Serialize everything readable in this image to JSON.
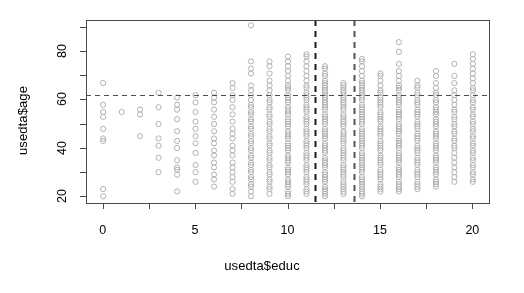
{
  "figure": {
    "type": "r-base-scatterplot",
    "width": 524,
    "height": 293,
    "background": "#ffffff"
  },
  "axes": {
    "x_title": "usedta$educ",
    "y_title": "usedta$age",
    "x_ticks": [
      "0",
      "5",
      "10",
      "15",
      "20"
    ],
    "y_ticks": [
      "20",
      "40",
      "60",
      "80"
    ]
  },
  "chart_data": {
    "type": "scatter",
    "title": "",
    "subtitle": "",
    "xlabel": "usedta$educ",
    "ylabel": "usedta$age",
    "xlim": [
      -0.9,
      20.9
    ],
    "ylim": [
      17,
      93
    ],
    "x_ticks": [
      0,
      5,
      10,
      15,
      20
    ],
    "y_ticks": [
      20,
      40,
      60,
      80
    ],
    "x_minor_ticks": [
      2.5,
      7.5,
      12.5,
      17.5
    ],
    "y_minor_ticks": [
      30,
      50,
      70,
      90
    ],
    "grid": false,
    "legend": null,
    "point_marker": "open-circle",
    "point_color": "#b0b0b0",
    "point_radius": 2.6,
    "annotations": [
      {
        "name": "horizontal-reference-line",
        "orientation": "horizontal",
        "y": 62,
        "style": "dashed",
        "color": "#4d4d4d"
      },
      {
        "name": "vertical-reference-line-lower",
        "orientation": "vertical",
        "x": 11.5,
        "style": "dashed",
        "color": "#1a1a1a"
      },
      {
        "name": "vertical-reference-line-upper",
        "orientation": "vertical",
        "x": 13.6,
        "style": "dashed",
        "color": "#555555"
      }
    ],
    "series": [
      {
        "name": "age-vs-educ",
        "columns": [
          {
            "x": 0,
            "y_min": 20,
            "y_max": 67,
            "count": 9,
            "y": [
              20,
              23,
              43,
              44,
              48,
              53,
              55,
              58,
              67
            ]
          },
          {
            "x": 1,
            "y_min": 55,
            "y_max": 55,
            "count": 1,
            "y": [
              55
            ]
          },
          {
            "x": 2,
            "y_min": 45,
            "y_max": 56,
            "count": 3,
            "y": [
              45,
              54,
              56
            ]
          },
          {
            "x": 3,
            "y_min": 30,
            "y_max": 63,
            "count": 7,
            "y": [
              30,
              36,
              41,
              44,
              50,
              57,
              63
            ]
          },
          {
            "x": 4,
            "y_min": 22,
            "y_max": 61,
            "count": 12,
            "y": [
              22,
              29,
              31,
              32,
              35,
              40,
              43,
              47,
              52,
              56,
              58,
              61
            ]
          },
          {
            "x": 5,
            "y_min": 26,
            "y_max": 62,
            "count": 11,
            "y": [
              26,
              30,
              33,
              38,
              42,
              45,
              48,
              51,
              55,
              59,
              62
            ]
          },
          {
            "x": 6,
            "y_min": 24,
            "y_max": 63,
            "count": 16,
            "y": [
              24,
              27,
              29,
              32,
              34,
              37,
              39,
              42,
              44,
              47,
              50,
              53,
              56,
              59,
              61,
              63
            ]
          },
          {
            "x": 7,
            "y_min": 21,
            "y_max": 67,
            "count": 20,
            "y": [
              21,
              23,
              26,
              28,
              30,
              32,
              34,
              37,
              39,
              41,
              44,
              46,
              48,
              51,
              54,
              57,
              60,
              62,
              65,
              67
            ]
          },
          {
            "x": 8,
            "y_min": 20,
            "y_max": 91,
            "count": 34,
            "y": [
              20,
              22,
              24,
              25,
              27,
              28,
              30,
              31,
              33,
              34,
              36,
              37,
              39,
              40,
              42,
              43,
              45,
              46,
              48,
              49,
              51,
              52,
              54,
              55,
              57,
              58,
              60,
              62,
              64,
              66,
              71,
              73,
              76,
              91
            ]
          },
          {
            "x": 9,
            "y_min": 21,
            "y_max": 76,
            "count": 34,
            "y": [
              21,
              23,
              24,
              26,
              27,
              29,
              30,
              32,
              33,
              35,
              36,
              38,
              39,
              41,
              42,
              44,
              45,
              47,
              48,
              50,
              51,
              53,
              54,
              56,
              57,
              59,
              60,
              62,
              64,
              66,
              68,
              71,
              74,
              76
            ]
          },
          {
            "x": 10,
            "y_min": 20,
            "y_max": 78,
            "count": 44,
            "y": [
              20,
              21,
              22,
              24,
              25,
              26,
              27,
              29,
              30,
              31,
              32,
              34,
              35,
              36,
              37,
              39,
              40,
              41,
              42,
              44,
              45,
              46,
              47,
              49,
              50,
              51,
              52,
              54,
              55,
              56,
              57,
              59,
              60,
              61,
              62,
              64,
              65,
              66,
              68,
              70,
              72,
              74,
              76,
              78
            ]
          },
          {
            "x": 11,
            "y_min": 21,
            "y_max": 79,
            "count": 44,
            "y": [
              21,
              22,
              23,
              25,
              26,
              27,
              28,
              30,
              31,
              32,
              33,
              35,
              36,
              37,
              38,
              40,
              41,
              42,
              43,
              45,
              46,
              47,
              48,
              50,
              51,
              52,
              53,
              55,
              56,
              57,
              58,
              60,
              61,
              62,
              63,
              65,
              66,
              68,
              70,
              72,
              74,
              76,
              78,
              79
            ]
          },
          {
            "x": 12,
            "y_min": 20,
            "y_max": 74,
            "count": 47,
            "y": [
              20,
              21,
              22,
              23,
              24,
              26,
              27,
              28,
              29,
              30,
              32,
              33,
              34,
              35,
              36,
              38,
              39,
              40,
              41,
              42,
              44,
              45,
              46,
              47,
              48,
              50,
              51,
              52,
              53,
              54,
              56,
              57,
              58,
              59,
              60,
              61,
              62,
              63,
              64,
              65,
              66,
              67,
              68,
              70,
              71,
              73,
              74
            ]
          },
          {
            "x": 13,
            "y_min": 21,
            "y_max": 67,
            "count": 42,
            "y": [
              21,
              22,
              23,
              24,
              25,
              26,
              28,
              29,
              30,
              31,
              32,
              33,
              35,
              36,
              37,
              38,
              39,
              40,
              42,
              43,
              44,
              45,
              46,
              47,
              49,
              50,
              51,
              52,
              53,
              54,
              56,
              57,
              58,
              59,
              60,
              61,
              62,
              63,
              64,
              65,
              66,
              67
            ]
          },
          {
            "x": 14,
            "y_min": 20,
            "y_max": 77,
            "count": 50,
            "y": [
              20,
              21,
              22,
              23,
              24,
              25,
              26,
              27,
              28,
              30,
              31,
              32,
              33,
              34,
              35,
              36,
              37,
              38,
              40,
              41,
              42,
              43,
              44,
              45,
              46,
              47,
              48,
              50,
              51,
              52,
              53,
              54,
              55,
              56,
              57,
              58,
              60,
              61,
              62,
              63,
              64,
              65,
              66,
              67,
              68,
              70,
              72,
              74,
              76,
              77
            ]
          },
          {
            "x": 15,
            "y_min": 22,
            "y_max": 71,
            "count": 40,
            "y": [
              22,
              23,
              24,
              25,
              27,
              28,
              29,
              30,
              31,
              33,
              34,
              35,
              36,
              37,
              39,
              40,
              41,
              42,
              43,
              45,
              46,
              47,
              48,
              49,
              51,
              52,
              53,
              54,
              55,
              57,
              58,
              59,
              60,
              61,
              63,
              64,
              66,
              68,
              70,
              71
            ]
          },
          {
            "x": 16,
            "y_min": 22,
            "y_max": 84,
            "count": 44,
            "y": [
              22,
              23,
              24,
              25,
              26,
              28,
              29,
              30,
              31,
              32,
              34,
              35,
              36,
              37,
              38,
              40,
              41,
              42,
              43,
              44,
              46,
              47,
              48,
              49,
              50,
              52,
              53,
              54,
              55,
              56,
              58,
              59,
              60,
              61,
              62,
              64,
              65,
              66,
              68,
              70,
              72,
              75,
              80,
              84
            ]
          },
          {
            "x": 17,
            "y_min": 23,
            "y_max": 68,
            "count": 36,
            "y": [
              23,
              24,
              25,
              26,
              28,
              29,
              30,
              31,
              33,
              34,
              35,
              36,
              38,
              39,
              40,
              41,
              43,
              44,
              45,
              46,
              48,
              49,
              50,
              51,
              53,
              54,
              55,
              56,
              58,
              59,
              60,
              62,
              63,
              65,
              66,
              68
            ]
          },
          {
            "x": 18,
            "y_min": 24,
            "y_max": 72,
            "count": 36,
            "y": [
              24,
              25,
              26,
              27,
              29,
              30,
              31,
              32,
              34,
              35,
              36,
              37,
              39,
              40,
              41,
              42,
              44,
              45,
              46,
              47,
              49,
              50,
              51,
              52,
              54,
              55,
              56,
              57,
              59,
              60,
              62,
              63,
              65,
              67,
              70,
              72
            ]
          },
          {
            "x": 19,
            "y_min": 26,
            "y_max": 75,
            "count": 26,
            "y": [
              26,
              28,
              30,
              32,
              34,
              36,
              38,
              40,
              41,
              43,
              44,
              46,
              47,
              49,
              50,
              52,
              53,
              55,
              56,
              58,
              60,
              62,
              64,
              67,
              70,
              75
            ]
          },
          {
            "x": 20,
            "y_min": 26,
            "y_max": 79,
            "count": 34,
            "y": [
              26,
              27,
              29,
              30,
              32,
              33,
              35,
              36,
              38,
              39,
              41,
              42,
              44,
              45,
              47,
              48,
              50,
              51,
              53,
              54,
              56,
              57,
              59,
              60,
              62,
              64,
              65,
              67,
              69,
              71,
              73,
              75,
              77,
              79
            ]
          }
        ]
      }
    ]
  }
}
